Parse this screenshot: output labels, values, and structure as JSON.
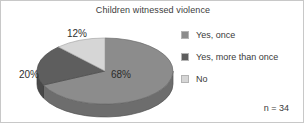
{
  "chart": {
    "title": "Children witnessed violence",
    "sample_size_note": "n = 34"
  },
  "legend": {
    "items": [
      {
        "label": "Yes, once",
        "color": "#8c8c8c",
        "swatch_name": "legend-swatch-yes-once"
      },
      {
        "label": "Yes, more than once",
        "color": "#5e5e5e",
        "swatch_name": "legend-swatch-yes-more-than-once"
      },
      {
        "label": "No",
        "color": "#d6d6d6",
        "swatch_name": "legend-swatch-no"
      }
    ]
  },
  "labels": {
    "no": "12%",
    "more_than_once": "20%",
    "once": "68%"
  },
  "chart_data": {
    "type": "pie",
    "title": "Children witnessed violence",
    "categories": [
      "Yes, once",
      "Yes, more than once",
      "No"
    ],
    "values": [
      68,
      20,
      12
    ],
    "value_labels": [
      "68%",
      "20%",
      "12%"
    ],
    "units": "percent",
    "colors": [
      "#8c8c8c",
      "#5e5e5e",
      "#d6d6d6"
    ],
    "side_colors": [
      "#6e6e6e",
      "#4a4a4a",
      "#a8a8a8"
    ],
    "legend": [
      "Yes, once",
      "Yes, more than once",
      "No"
    ],
    "legend_position": "right",
    "annotations": [
      "n = 34"
    ],
    "three_d": true,
    "start_angle_deg": 270,
    "direction": "clockwise",
    "grid": false,
    "xlabel": "",
    "ylabel": ""
  }
}
